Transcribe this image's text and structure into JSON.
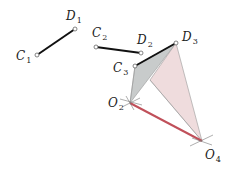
{
  "diagram": {
    "colors": {
      "link": "#111111",
      "ground_link": "#c0505a",
      "coupler_gray": "#c8cbcb",
      "coupler_pink": "#efdcdd",
      "construction": "#888888",
      "pivot_fill": "#ffffff"
    },
    "points": {
      "C1": {
        "label": "C",
        "sub": "1",
        "x": 37,
        "y": 55
      },
      "D1": {
        "label": "D",
        "sub": "1",
        "x": 75,
        "y": 29
      },
      "C2": {
        "label": "C",
        "sub": "2",
        "x": 96,
        "y": 47
      },
      "D2": {
        "label": "D",
        "sub": "2",
        "x": 141,
        "y": 53
      },
      "C3": {
        "label": "C",
        "sub": "3",
        "x": 135,
        "y": 66
      },
      "D3": {
        "label": "D",
        "sub": "3",
        "x": 176,
        "y": 43
      },
      "O2": {
        "label": "O",
        "sub": "2",
        "x": 130,
        "y": 103
      },
      "O4": {
        "label": "O",
        "sub": "4",
        "x": 202,
        "y": 141
      }
    },
    "labels": [
      {
        "id": "C1",
        "text": "C",
        "sub": "1"
      },
      {
        "id": "D1",
        "text": "D",
        "sub": "1"
      },
      {
        "id": "C2",
        "text": "C",
        "sub": "2"
      },
      {
        "id": "D2",
        "text": "D",
        "sub": "2"
      },
      {
        "id": "C3",
        "text": "C",
        "sub": "3"
      },
      {
        "id": "D3",
        "text": "D",
        "sub": "3"
      },
      {
        "id": "O2",
        "text": "O",
        "sub": "2"
      },
      {
        "id": "O4",
        "text": "O",
        "sub": "4"
      }
    ]
  }
}
